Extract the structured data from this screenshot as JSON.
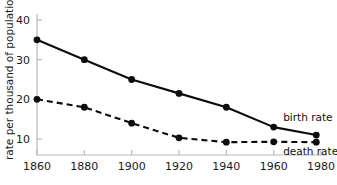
{
  "chart_data": {
    "type": "line",
    "title": "",
    "subtitle": "",
    "xlabel": "",
    "ylabel": "rate per thousand of population",
    "x": [
      1860,
      1880,
      1900,
      1920,
      1940,
      1960,
      1978
    ],
    "xlim": [
      1860,
      1980
    ],
    "ylim": [
      0,
      42
    ],
    "xticks": [
      1860,
      1880,
      1900,
      1920,
      1940,
      1960,
      1980
    ],
    "xtick_labels": [
      "1860",
      "1880",
      "1900",
      "1920",
      "1940",
      "1960",
      "1980"
    ],
    "yticks": [
      10,
      20,
      30,
      40
    ],
    "ytick_labels": [
      "10",
      "20",
      "30",
      "40"
    ],
    "grid": false,
    "legend_position": "inline-right",
    "series": [
      {
        "name": "birth rate",
        "style": "solid",
        "marker": "filled-circle",
        "color": "#0d0d0d",
        "values": [
          35,
          30,
          25,
          21.5,
          18,
          13,
          11
        ]
      },
      {
        "name": "death rate",
        "style": "dashed",
        "marker": "filled-circle",
        "color": "#0d0d0d",
        "values": [
          20,
          18,
          14,
          10.3,
          9.2,
          9.3,
          9.2
        ]
      }
    ],
    "annotations": [
      {
        "text": "birth rate",
        "x": 1964,
        "y": 14.5
      },
      {
        "text": "death rate",
        "x": 1964,
        "y": 6.0
      }
    ],
    "colors": {
      "axis": "#b8b8b8",
      "ink": "#0d0d0d",
      "background": "#ffffff"
    }
  }
}
